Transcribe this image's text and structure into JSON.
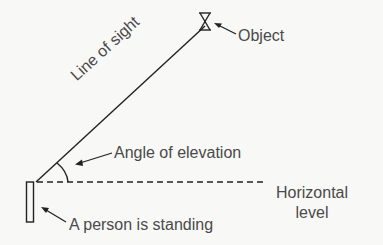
{
  "diagram": {
    "type": "angle-of-elevation",
    "labels": {
      "object": "Object",
      "line_of_sight": "Line of sight",
      "angle": "Angle of elevation",
      "horizontal_line1": "Horizontal",
      "horizontal_line2": "level",
      "person": "A person is standing"
    },
    "icons": {
      "object": "hourglass-icon",
      "person": "rectangle-person-icon"
    },
    "colors": {
      "stroke": "#222222",
      "text": "#4a4a4a",
      "background": "#f8f8f6"
    }
  }
}
